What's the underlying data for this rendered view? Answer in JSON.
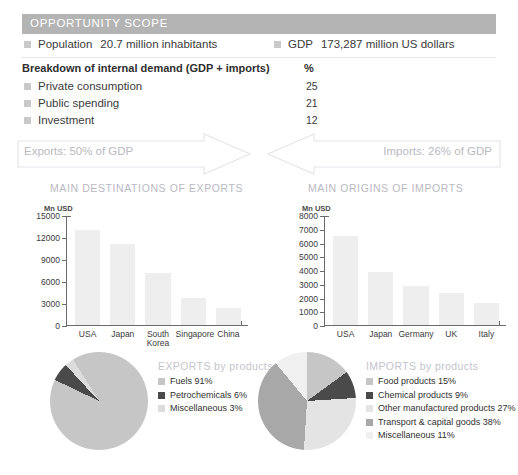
{
  "scope": {
    "header": "OPPORTUNITY SCOPE",
    "population": {
      "label": "Population",
      "value": "20.7 million inhabitants"
    },
    "gdp": {
      "label": "GDP",
      "value": "173,287 million US dollars"
    },
    "breakdown_title": "Breakdown of internal demand (GDP + imports)",
    "breakdown_unit": "%",
    "breakdown": [
      {
        "label": "Private consumption",
        "value": "25"
      },
      {
        "label": "Public spending",
        "value": "21"
      },
      {
        "label": "Investment",
        "value": "12"
      }
    ]
  },
  "arrows": {
    "exports_label": "Exports: 50% of GDP",
    "imports_label": "Imports: 26% of GDP"
  },
  "sections": {
    "exports_title": "MAIN DESTINATIONS OF EXPORTS",
    "imports_title": "MAIN ORIGINS OF IMPORTS",
    "axis_unit": "Mn USD"
  },
  "colors": {
    "header_bar": "#b4b4b4",
    "bar_fill": "#eeeeee",
    "muted_text": "#b9b9bf",
    "pie_dark": "#4a4a4a",
    "pie_mid": "#a8a8a8",
    "pie_light": "#c6c6c6",
    "pie_lighter": "#dcdcdc",
    "pie_lightest": "#f0f0f0"
  },
  "chart_data": [
    {
      "type": "bar",
      "id": "main-destinations-of-exports",
      "title": "MAIN DESTINATIONS OF EXPORTS",
      "ylabel": "Mn USD",
      "xlabel": "",
      "categories": [
        "USA",
        "Japan",
        "South Korea",
        "Singapore",
        "China"
      ],
      "values": [
        13000,
        11000,
        7100,
        3700,
        2300
      ],
      "ylim": [
        0,
        15000
      ],
      "yticks": [
        0,
        3000,
        6000,
        9000,
        12000,
        15000
      ],
      "ytick_labels": [
        "0",
        "3000",
        "6000",
        "9000",
        "12000",
        "15000"
      ],
      "grid": false,
      "legend": "none"
    },
    {
      "type": "bar",
      "id": "main-origins-of-imports",
      "title": "MAIN ORIGINS OF IMPORTS",
      "ylabel": "Mn USD",
      "xlabel": "",
      "categories": [
        "USA",
        "Japan",
        "Germany",
        "UK",
        "Italy"
      ],
      "values": [
        6500,
        3850,
        2850,
        2300,
        1620
      ],
      "ylim": [
        0,
        8000
      ],
      "yticks": [
        0,
        1000,
        2000,
        3000,
        4000,
        5000,
        6000,
        7000,
        8000
      ],
      "ytick_labels": [
        "0",
        "1000",
        "2000",
        "3000",
        "4000",
        "5000",
        "6000",
        "7000",
        "8000"
      ],
      "grid": false,
      "legend": "none"
    },
    {
      "type": "pie",
      "id": "exports-by-products",
      "title": "EXPORTS by products",
      "labels": [
        "Fuels",
        "Petrochemicals",
        "Miscellaneous"
      ],
      "values": [
        91,
        6,
        3
      ],
      "value_suffix": "%",
      "colors": [
        "#c6c6c6",
        "#4a4a4a",
        "#dcdcdc"
      ],
      "legend": "right",
      "legend_entries": [
        "Fuels 91%",
        "Petrochemicals 6%",
        "Miscellaneous 3%"
      ]
    },
    {
      "type": "pie",
      "id": "imports-by-products",
      "title": "IMPORTS by products",
      "labels": [
        "Food products",
        "Chemical products",
        "Other manufactured products",
        "Transport & capital goods",
        "Miscellaneous"
      ],
      "values": [
        15,
        9,
        27,
        38,
        11
      ],
      "value_suffix": "%",
      "colors": [
        "#c6c6c6",
        "#4a4a4a",
        "#e4e4e4",
        "#a8a8a8",
        "#f0f0f0"
      ],
      "legend": "right",
      "legend_entries": [
        "Food products 15%",
        "Chemical products 9%",
        "Other manufactured products 27%",
        "Transport & capital goods 38%",
        "Miscellaneous 11%"
      ]
    }
  ]
}
